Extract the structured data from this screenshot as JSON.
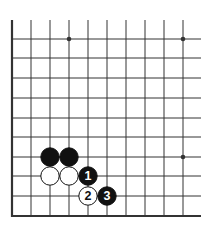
{
  "diagram": {
    "type": "go-board-fragment",
    "columns": 10,
    "rows": 10,
    "edges": [
      "left",
      "bottom"
    ],
    "grid": {
      "x": [
        12,
        31,
        50,
        69,
        88,
        107,
        126,
        145,
        164,
        183
      ],
      "y": [
        39,
        58,
        78,
        98,
        118,
        137,
        157,
        176,
        196,
        216
      ],
      "line_top": 20,
      "line_right": 201
    },
    "star_points": [
      {
        "col": 3,
        "row": 0
      },
      {
        "col": 9,
        "row": 0
      },
      {
        "col": 9,
        "row": 6
      }
    ],
    "stones": [
      {
        "color": "black",
        "col": 2,
        "row": 6,
        "label": ""
      },
      {
        "color": "black",
        "col": 3,
        "row": 6,
        "label": ""
      },
      {
        "color": "white",
        "col": 2,
        "row": 7,
        "label": ""
      },
      {
        "color": "white",
        "col": 3,
        "row": 7,
        "label": ""
      },
      {
        "color": "black",
        "col": 4,
        "row": 7,
        "label": "1"
      },
      {
        "color": "white",
        "col": 4,
        "row": 8,
        "label": "2"
      },
      {
        "color": "black",
        "col": 5,
        "row": 8,
        "label": "3"
      }
    ],
    "colors": {
      "line": "#333333",
      "black_stone": "#111111",
      "white_stone": "#ffffff"
    }
  }
}
